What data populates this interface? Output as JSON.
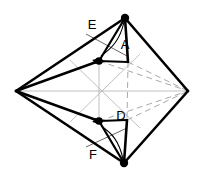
{
  "figure": {
    "name": "octahedron-bipyramid-diagram",
    "background_color": "#ffffff",
    "width": 206,
    "height": 187,
    "edge_color": "#000000",
    "hidden_edge_color": "#a9a9a9",
    "axis_color": "#b0b0b0",
    "vertex_dot_color": "#000000",
    "labels": [
      {
        "id": "label-A",
        "text": "A",
        "x": 125,
        "y": 46
      },
      {
        "id": "label-D",
        "text": "D",
        "x": 121,
        "y": 117
      },
      {
        "id": "label-E",
        "text": "E",
        "x": 92,
        "y": 26
      },
      {
        "id": "label-F",
        "text": "F",
        "x": 93,
        "y": 156
      }
    ],
    "vertices": [
      {
        "id": "vertex-top",
        "x": 125,
        "y": 18,
        "dot": true,
        "radius": 4.2
      },
      {
        "id": "vertex-bottom",
        "x": 124,
        "y": 163,
        "dot": true,
        "radius": 4.2
      },
      {
        "id": "vertex-left",
        "x": 16,
        "y": 91,
        "dot": false,
        "radius": 0
      },
      {
        "id": "vertex-right",
        "x": 188,
        "y": 91,
        "dot": false,
        "radius": 0
      },
      {
        "id": "vertex-inner-upper",
        "x": 99,
        "y": 61,
        "dot": true,
        "radius": 3.8
      },
      {
        "id": "vertex-inner-lower",
        "x": 99,
        "y": 121,
        "dot": true,
        "radius": 3.8
      }
    ],
    "solid_edges": [
      {
        "id": "edge-top-to-inner-upper",
        "x1": 125,
        "y1": 18,
        "x2": 99,
        "y2": 61,
        "width": 2.2
      },
      {
        "id": "edge-top-to-left",
        "x1": 125,
        "y1": 18,
        "x2": 16,
        "y2": 91,
        "width": 2.6
      },
      {
        "id": "edge-top-to-right",
        "x1": 125,
        "y1": 18,
        "x2": 188,
        "y2": 91,
        "width": 2.6
      },
      {
        "id": "edge-top-to-apexA",
        "x1": 125,
        "y1": 18,
        "x2": 128,
        "y2": 62,
        "width": 2.6
      },
      {
        "id": "edge-apexA-to-inner-upper",
        "x1": 128,
        "y1": 62,
        "x2": 99,
        "y2": 61,
        "width": 2.2
      },
      {
        "id": "edge-inner-upper-to-left",
        "x1": 99,
        "y1": 61,
        "x2": 16,
        "y2": 91,
        "width": 2.4
      },
      {
        "id": "edge-bottom-to-inner-lower",
        "x1": 124,
        "y1": 163,
        "x2": 99,
        "y2": 121,
        "width": 2.2
      },
      {
        "id": "edge-bottom-to-left",
        "x1": 124,
        "y1": 163,
        "x2": 16,
        "y2": 91,
        "width": 2.6
      },
      {
        "id": "edge-bottom-to-right",
        "x1": 124,
        "y1": 163,
        "x2": 188,
        "y2": 91,
        "width": 2.6
      },
      {
        "id": "edge-bottom-to-apexD",
        "x1": 124,
        "y1": 163,
        "x2": 127,
        "y2": 120,
        "width": 2.6
      },
      {
        "id": "edge-apexD-to-inner-lower",
        "x1": 127,
        "y1": 120,
        "x2": 99,
        "y2": 121,
        "width": 2.2
      },
      {
        "id": "edge-inner-lower-to-left",
        "x1": 99,
        "y1": 121,
        "x2": 16,
        "y2": 91,
        "width": 2.4
      }
    ],
    "hidden_edges": [
      {
        "id": "hidden-edge-apexA-to-right",
        "x1": 128,
        "y1": 62,
        "x2": 188,
        "y2": 91
      },
      {
        "id": "hidden-edge-apexD-to-right",
        "x1": 127,
        "y1": 120,
        "x2": 188,
        "y2": 91
      },
      {
        "id": "hidden-edge-apexA-to-apexD",
        "x1": 128,
        "y1": 62,
        "x2": 127,
        "y2": 120
      },
      {
        "id": "hidden-edge-inner-upper-to-right",
        "x1": 99,
        "y1": 61,
        "x2": 188,
        "y2": 91
      },
      {
        "id": "hidden-edge-inner-lower-to-right",
        "x1": 99,
        "y1": 121,
        "x2": 188,
        "y2": 91
      }
    ],
    "axis_lines": [
      {
        "id": "axis-horizontal",
        "x1": 16,
        "y1": 91,
        "x2": 188,
        "y2": 91
      },
      {
        "id": "axis-vertical",
        "x1": 99,
        "y1": 58,
        "x2": 99,
        "y2": 124
      },
      {
        "id": "axis-diagonal-a",
        "x1": 70,
        "y1": 60,
        "x2": 140,
        "y2": 128
      },
      {
        "id": "axis-diagonal-b",
        "x1": 70,
        "y1": 122,
        "x2": 140,
        "y2": 54
      }
    ],
    "arrows": [
      {
        "id": "arrow-E-to-inner-upper",
        "path": "M 124 22 C 120 40 112 48 101 56",
        "tip_x": 99,
        "tip_y": 58,
        "angle_deg": 140
      },
      {
        "id": "arrow-F-to-inner-lower",
        "path": "M 123 159 C 119 141 112 133 101 126",
        "tip_x": 99,
        "tip_y": 124,
        "angle_deg": 220
      }
    ],
    "leader_lines": [
      {
        "id": "leader-E",
        "x1": 86,
        "y1": 34,
        "x2": 127,
        "y2": 56
      },
      {
        "id": "leader-F",
        "x1": 86,
        "y1": 147,
        "x2": 127,
        "y2": 128
      }
    ]
  }
}
